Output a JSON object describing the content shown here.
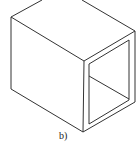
{
  "figure": {
    "label": "b)",
    "stroke_color": "#333333",
    "background": "#ffffff"
  }
}
